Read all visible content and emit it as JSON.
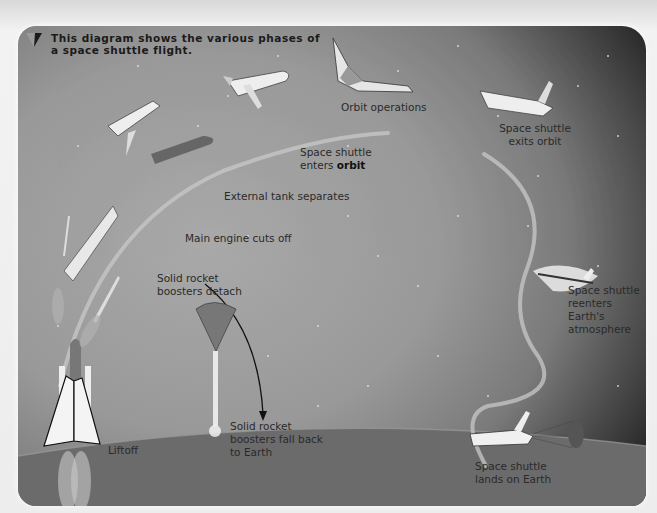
{
  "caption": "This diagram shows the various phases of a space shuttle flight.",
  "phases": {
    "liftoff": "Liftoff",
    "boosters_detach": {
      "line1": "Solid rocket",
      "line2": "boosters detach"
    },
    "main_engine_cutoff": "Main engine cuts off",
    "tank_separates": "External tank separates",
    "enters_orbit": {
      "line1": "Space shuttle",
      "line2_prefix": "enters ",
      "line2_bold": "orbit"
    },
    "orbit_operations": "Orbit operations",
    "exits_orbit": {
      "line1": "Space shuttle",
      "line2": "exits orbit"
    },
    "reenters": {
      "line1": "Space shuttle",
      "line2": "reenters",
      "line3": "Earth's",
      "line4": "atmosphere"
    },
    "lands": {
      "line1": "Space shuttle",
      "line2": "lands on Earth"
    },
    "boosters_fall": {
      "line1": "Solid rocket",
      "line2": "boosters fall back",
      "line3": "to Earth"
    }
  },
  "colors": {
    "space_light": "#a9a9a9",
    "space_dark": "#222222",
    "trajectory": "#c8c8c8",
    "text": "#2a2a2a"
  }
}
